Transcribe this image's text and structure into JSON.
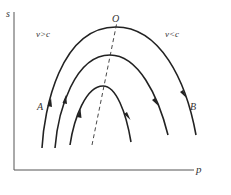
{
  "diagram": {
    "axes": {
      "y_label": "s",
      "x_label": "p"
    },
    "labels": {
      "peak": "O",
      "left_region": "v>c",
      "right_region": "v<c",
      "curve_left": "A",
      "curve_right": "B"
    },
    "curves": [
      {
        "name": "outer-curve",
        "peak": [
          116,
          27
        ]
      },
      {
        "name": "middle-curve",
        "peak": [
          110,
          55
        ]
      },
      {
        "name": "inner-curve",
        "peak": [
          103,
          86
        ]
      }
    ],
    "colors": {
      "line": "#222222",
      "axis": "#555555"
    }
  }
}
